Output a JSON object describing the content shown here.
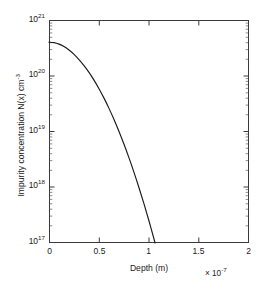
{
  "figure": {
    "background_color": "#ffffff",
    "axis_color": "#3a3a3a",
    "curve_color": "#1a1a1a"
  },
  "chart_data": {
    "type": "line",
    "title": "",
    "xlabel": "Depth (m)",
    "ylabel": "Impurity concentration N(x) cm",
    "ylabel_exponent": "-3",
    "x_exponent_prefix": "× 10",
    "x_exponent_value": "-7",
    "xscale": "linear",
    "yscale": "log",
    "xlim": [
      0,
      2e-07
    ],
    "ylim": [
      1e+17,
      1e+21
    ],
    "grid": false,
    "legend": null,
    "xticks": [
      0,
      0.5,
      1,
      1.5,
      2
    ],
    "xtick_labels": [
      "0",
      "0.5",
      "1",
      "1.5",
      "2"
    ],
    "yticks": [
      1e+17,
      1e+18,
      1e+19,
      1e+20,
      1e+21
    ],
    "ytick_mantissa": "10",
    "ytick_exponents": [
      "17",
      "18",
      "19",
      "20",
      "21"
    ],
    "series": [
      {
        "name": "N(x)",
        "x": [
          0.0,
          0.05,
          0.1,
          0.15,
          0.2,
          0.25,
          0.3,
          0.35,
          0.4,
          0.45,
          0.5,
          0.55,
          0.6,
          0.65,
          0.7,
          0.75,
          0.8,
          0.85,
          0.9,
          0.95,
          1.0,
          1.05,
          1.1,
          1.15,
          1.2,
          1.25,
          1.3,
          1.35,
          1.4,
          1.45,
          1.5,
          1.55,
          1.6,
          1.65,
          1.7,
          1.75,
          1.78
        ],
        "y": [
          4e+20,
          3.92e+20,
          3.69e+20,
          3.33e+20,
          2.89e+20,
          2.42e+20,
          1.95e+20,
          1.52e+20,
          1.15e+20,
          8.35e+19,
          5.86e+19,
          3.97e+19,
          2.6e+19,
          1.64e+19,
          1e+19,
          5.9e+18,
          3.36e+18,
          1.85e+18,
          9.8e+17,
          5.02e+17,
          2.48e+17,
          1.18e+17,
          5.45e+16,
          2.43e+16,
          1.05e+16,
          4360000000000000.0,
          1750000000000000.0,
          679000000000000.0,
          255000000000000.0,
          92200000000000.0,
          32300000000000.0,
          10900000000000.0,
          3570000000000.0,
          1130000000000.0,
          345000000000.0,
          102000000000.0,
          53000000000.0
        ],
        "x_units": "1e-7 m",
        "y_units": "cm^-3",
        "notes": "Gaussian-like diffusion profile; surface concentration ~4e20 cm^-3, crosses 1e17 cm^-3 at about x = 1.78e-7 m"
      }
    ],
    "plot_box_px": {
      "left": 49,
      "top": 20,
      "right": 249,
      "bottom": 243
    }
  }
}
